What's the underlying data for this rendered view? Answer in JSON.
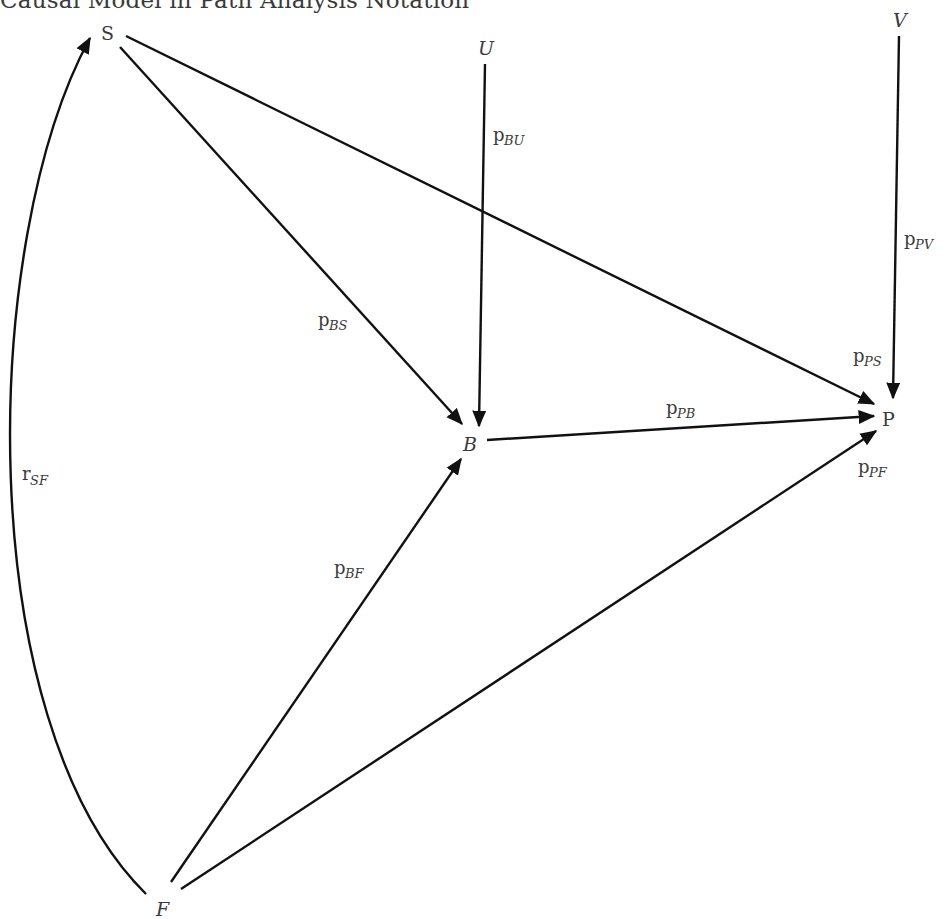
{
  "title": "Causal Model in Path Analysis Notation",
  "nodes": {
    "S": {
      "label": "S",
      "x": 108,
      "y": 40
    },
    "U": {
      "label": "U",
      "x": 485,
      "y": 50
    },
    "V": {
      "label": "V",
      "x": 901,
      "y": 27
    },
    "B": {
      "label": "B",
      "x": 470,
      "y": 445
    },
    "P": {
      "label": "P",
      "x": 888,
      "y": 421
    },
    "F": {
      "label": "F",
      "x": 163,
      "y": 912
    }
  },
  "edges": [
    {
      "from": "S",
      "to": "B",
      "label": "p",
      "subscript": "BS"
    },
    {
      "from": "S",
      "to": "P",
      "label": "p",
      "subscript": "PS"
    },
    {
      "from": "U",
      "to": "B",
      "label": "p",
      "subscript": "BU"
    },
    {
      "from": "V",
      "to": "P",
      "label": "p",
      "subscript": "PV"
    },
    {
      "from": "B",
      "to": "P",
      "label": "p",
      "subscript": "PB"
    },
    {
      "from": "F",
      "to": "B",
      "label": "p",
      "subscript": "BF"
    },
    {
      "from": "F",
      "to": "P",
      "label": "p",
      "subscript": "PF"
    },
    {
      "from": "F",
      "to": "S",
      "label": "r",
      "subscript": "SF",
      "type": "correlation"
    }
  ],
  "edge_labels": {
    "pBS": {
      "main": "p",
      "sub": "BS"
    },
    "pPS": {
      "main": "p",
      "sub": "PS"
    },
    "pBU": {
      "main": "p",
      "sub": "BU"
    },
    "pPV": {
      "main": "p",
      "sub": "PV"
    },
    "pPB": {
      "main": "p",
      "sub": "PB"
    },
    "pBF": {
      "main": "p",
      "sub": "BF"
    },
    "pPF": {
      "main": "p",
      "sub": "PF"
    },
    "rSF": {
      "main": "r",
      "sub": "SF"
    }
  }
}
